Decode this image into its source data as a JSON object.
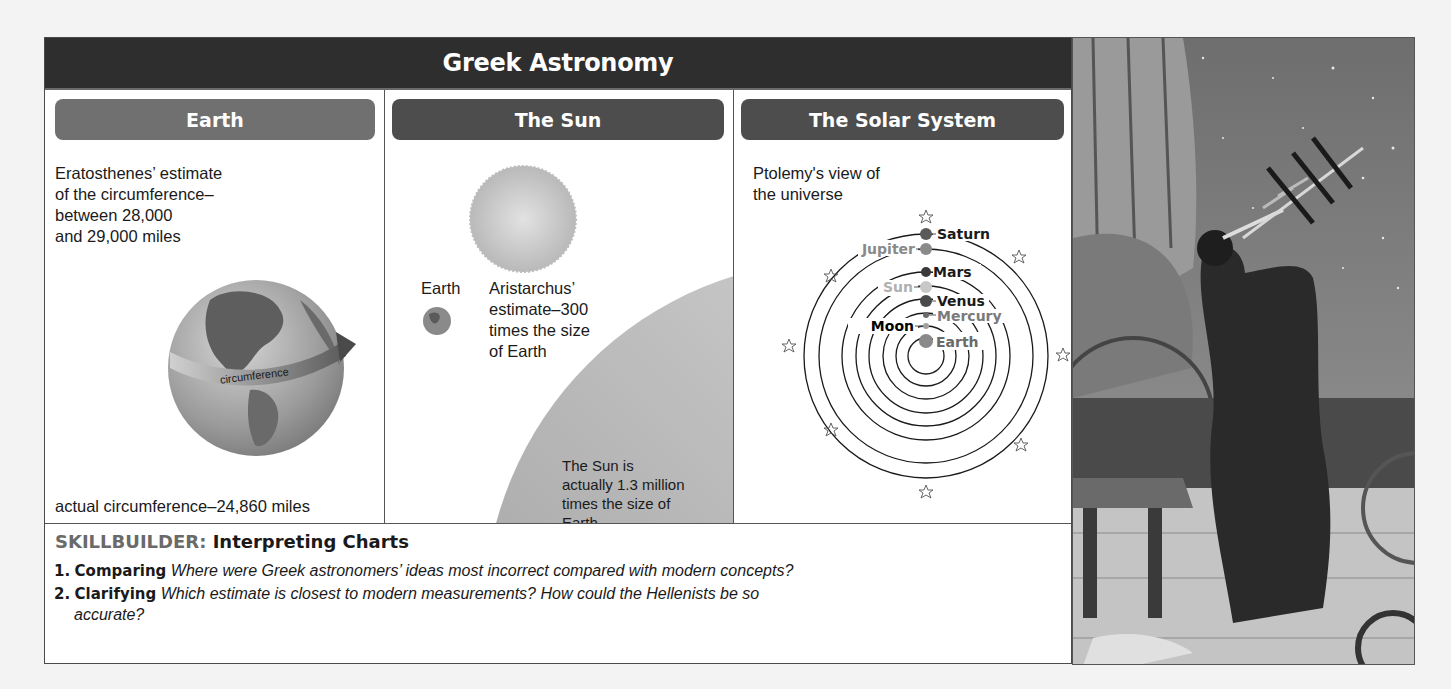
{
  "page": {
    "title": "Greek Astronomy",
    "background_text_lines": [
      "",
      "",
      "",
      "",
      "great prior and knowledge about the spherical nature of the world...",
      "cubes to knowledge of ptolemy while patterns estimates about earth ...",
      "classify to Greek astronomy.",
      "",
      "",
      "",
      "",
      "",
      "",
      "",
      "",
      "Alexandria had its own research center for the study of science...",
      "Instructions such as mathematics were constructed for geometry...",
      "teaching about other major philosophers of physics and astronomy",
      "conceived of a world long before Greeks and research studies...",
      "that were a known fact..."
    ]
  },
  "columns": [
    {
      "id": "earth",
      "header": "Earth",
      "estimate_lines": [
        "Eratosthenes’ estimate",
        "of the circumference–",
        "between 28,000",
        "and 29,000 miles"
      ],
      "globe_label": "circumference",
      "actual": "actual circumference–24,860 miles"
    },
    {
      "id": "sun",
      "header": "The Sun",
      "earth_label": "Earth",
      "estimate_lines": [
        "Aristarchus’",
        "estimate–300",
        "times the size",
        "of Earth"
      ],
      "actual_lines": [
        "The Sun is",
        "actually 1.3 million",
        "times the size of",
        "Earth."
      ]
    },
    {
      "id": "solar-system",
      "header": "The Solar System",
      "caption_lines": [
        "Ptolemy's view of",
        "the universe"
      ],
      "bodies": [
        {
          "name": "Saturn",
          "side": "right",
          "color": "#4a4a4a",
          "label_color": "#1a1a1a"
        },
        {
          "name": "Jupiter",
          "side": "left",
          "color": "#8a8a8a",
          "label_color": "#8a8a8a"
        },
        {
          "name": "Mars",
          "side": "right",
          "color": "#3a3a3a",
          "label_color": "#1a1a1a"
        },
        {
          "name": "Sun",
          "side": "left",
          "color": "#c8c8c8",
          "label_color": "#b0b0b0"
        },
        {
          "name": "Venus",
          "side": "right",
          "color": "#4a4a4a",
          "label_color": "#1a1a1a"
        },
        {
          "name": "Mercury",
          "side": "right",
          "color": "#6a6a6a",
          "label_color": "#7a7a7a"
        },
        {
          "name": "Moon",
          "side": "left",
          "color": "#a0a0a0",
          "label_color": "#000000"
        },
        {
          "name": "Earth",
          "side": "right",
          "color": "#8a8a8a",
          "label_color": "#6a6a6a"
        }
      ]
    }
  ],
  "skillbuilder": {
    "lead": "SKILLBUILDER:",
    "title": "Interpreting Charts",
    "questions": [
      {
        "num": "1.",
        "keyword": "Comparing",
        "text": "Where were Greek astronomers’ ideas most incorrect compared with modern concepts?"
      },
      {
        "num": "2.",
        "keyword": "Clarifying",
        "text": "Which estimate is closest to modern measurements? How could the Hellenists be so",
        "text_cont": "accurate?"
      }
    ]
  },
  "photo": {
    "description": "Engraving of a Greek astronomer looking through an instrument at the night sky"
  }
}
